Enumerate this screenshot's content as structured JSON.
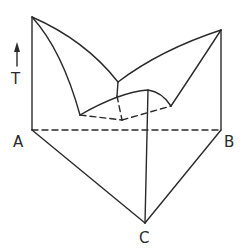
{
  "diagram": {
    "type": "ternary eutectic phase diagram (3D prism)",
    "axis_label": "T",
    "vertices": {
      "a": "A",
      "b": "B",
      "c": "C"
    },
    "colors": {
      "line": "#2a2a2a",
      "background": "#ffffff"
    }
  }
}
